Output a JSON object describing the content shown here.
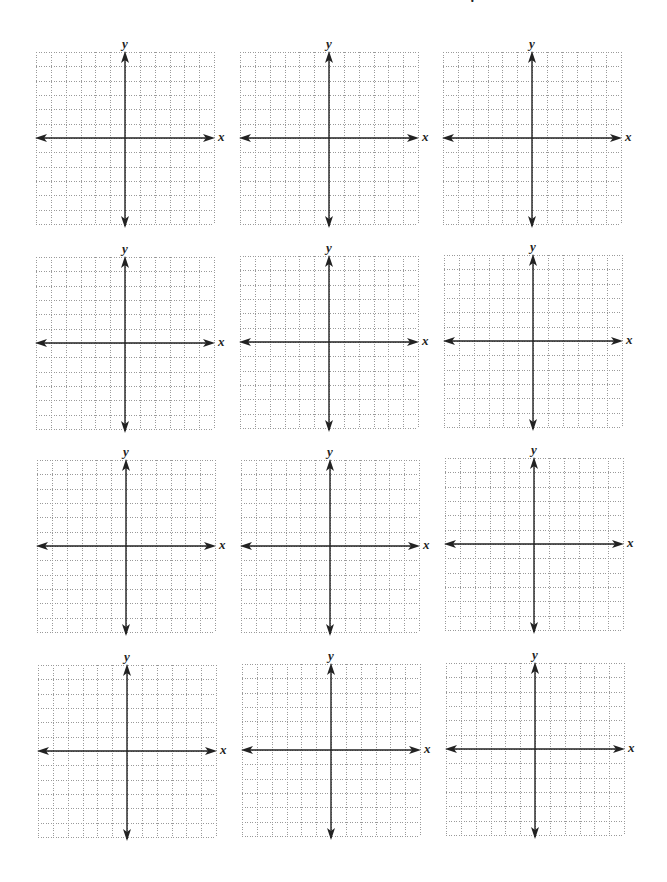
{
  "page": {
    "top_fragment_text": "· ·"
  },
  "grid_spec": {
    "columns": 12,
    "rows": 12,
    "x_axis_label": "x",
    "y_axis_label": "y",
    "grid_color": "#9a9a9a",
    "axis_color": "#222222"
  },
  "planes": [
    {
      "id": 1,
      "left": 36,
      "top": 52,
      "x_label": "x",
      "y_label": "y"
    },
    {
      "id": 2,
      "left": 240,
      "top": 52,
      "x_label": "x",
      "y_label": "y"
    },
    {
      "id": 3,
      "left": 443,
      "top": 52,
      "x_label": "x",
      "y_label": "y"
    },
    {
      "id": 4,
      "left": 36,
      "top": 257,
      "x_label": "x",
      "y_label": "y"
    },
    {
      "id": 5,
      "left": 240,
      "top": 256,
      "x_label": "x",
      "y_label": "y"
    },
    {
      "id": 6,
      "left": 444,
      "top": 255,
      "x_label": "x",
      "y_label": "y"
    },
    {
      "id": 7,
      "left": 37,
      "top": 460,
      "x_label": "x",
      "y_label": "y"
    },
    {
      "id": 8,
      "left": 241,
      "top": 460,
      "x_label": "x",
      "y_label": "y"
    },
    {
      "id": 9,
      "left": 445,
      "top": 458,
      "x_label": "x",
      "y_label": "y"
    },
    {
      "id": 10,
      "left": 38,
      "top": 665,
      "x_label": "x",
      "y_label": "y"
    },
    {
      "id": 11,
      "left": 242,
      "top": 664,
      "x_label": "x",
      "y_label": "y"
    },
    {
      "id": 12,
      "left": 446,
      "top": 663,
      "x_label": "x",
      "y_label": "y"
    }
  ]
}
